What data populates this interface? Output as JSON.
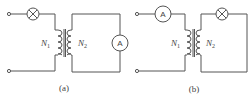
{
  "figure": {
    "panels": [
      {
        "id": "a",
        "caption": "(a)",
        "primary": {
          "label": "N",
          "sub": "1",
          "series_element": "lamp"
        },
        "secondary": {
          "label": "N",
          "sub": "2",
          "series_element": "ammeter"
        },
        "ammeter_symbol": "A"
      },
      {
        "id": "b",
        "caption": "(b)",
        "primary": {
          "label": "N",
          "sub": "1",
          "series_element": "ammeter"
        },
        "secondary": {
          "label": "N",
          "sub": "2",
          "series_element": "lamp"
        },
        "ammeter_symbol": "A"
      }
    ],
    "colors": {
      "line": "#555555",
      "background": "#ffffff"
    }
  }
}
